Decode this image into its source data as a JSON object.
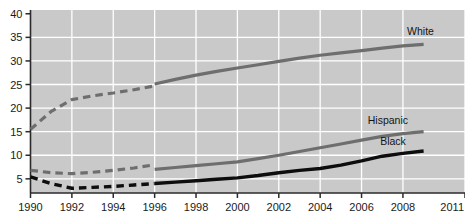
{
  "chart_data": {
    "type": "line",
    "title": "",
    "subtitle": "",
    "xlabel": "",
    "ylabel": "",
    "xlim": [
      1990,
      2011
    ],
    "ylim": [
      2,
      40.8
    ],
    "grid": true,
    "legend_position": "inline-right",
    "x_ticks": [
      "1990",
      "1992",
      "1994",
      "1996",
      "1998",
      "2000",
      "2002",
      "2004",
      "2006",
      "2008",
      "2011"
    ],
    "x_tick_values": [
      1990,
      1992,
      1994,
      1996,
      1998,
      2000,
      2002,
      2004,
      2006,
      2008,
      2011
    ],
    "y_ticks": [
      "5",
      "10",
      "15",
      "20",
      "25",
      "30",
      "35",
      "40"
    ],
    "y_tick_values": [
      5,
      10,
      15,
      20,
      25,
      30,
      35,
      40
    ],
    "plot_bg_color": "#c9c9c9",
    "grid_color": "#ffffff",
    "series": [
      {
        "name": "White",
        "label": "White",
        "color": "#6e6e6e",
        "width": 3.2,
        "x": [
          1990,
          1991,
          1992,
          1993,
          1994,
          1995,
          1996,
          1996,
          1997,
          1998,
          1999,
          2000,
          2001,
          2002,
          2003,
          2004,
          2005,
          2006,
          2007,
          2008,
          2009
        ],
        "values": [
          15.5,
          19.3,
          21.8,
          22.6,
          23.2,
          23.9,
          24.7,
          25.1,
          26.1,
          27.0,
          27.8,
          28.5,
          29.2,
          29.9,
          30.6,
          31.2,
          31.7,
          32.2,
          32.7,
          33.2,
          33.5
        ],
        "dash_until": 1996,
        "label_x": 2008.2,
        "label_y": 35.6
      },
      {
        "name": "Hispanic",
        "label": "Hispanic",
        "color": "#6e6e6e",
        "width": 3.2,
        "x": [
          1990,
          1991,
          1992,
          1993,
          1994,
          1995,
          1996,
          1996,
          1997,
          1998,
          1999,
          2000,
          2001,
          2002,
          2003,
          2004,
          2005,
          2006,
          2007,
          2008,
          2009
        ],
        "values": [
          6.8,
          6.3,
          6.1,
          6.4,
          6.8,
          7.3,
          8.0,
          7.0,
          7.4,
          7.8,
          8.2,
          8.6,
          9.3,
          10.0,
          10.8,
          11.6,
          12.4,
          13.2,
          14.0,
          14.6,
          15.0
        ],
        "dash_until": 1996,
        "label_x": 2006.3,
        "label_y": 16.6
      },
      {
        "name": "Black",
        "label": "Black",
        "color": "#0d0d0d",
        "width": 3.4,
        "x": [
          1990,
          1991,
          1992,
          1993,
          1994,
          1995,
          1996,
          1996,
          1997,
          1998,
          1999,
          2000,
          2001,
          2002,
          2003,
          2004,
          2005,
          2006,
          2007,
          2008,
          2009
        ],
        "values": [
          5.4,
          4.0,
          3.0,
          3.2,
          3.4,
          3.7,
          4.0,
          4.0,
          4.3,
          4.6,
          4.9,
          5.2,
          5.7,
          6.3,
          6.8,
          7.2,
          7.9,
          8.8,
          9.8,
          10.4,
          10.9
        ],
        "dash_until": 1996,
        "label_x": 2006.9,
        "label_y": 12.1
      }
    ]
  }
}
